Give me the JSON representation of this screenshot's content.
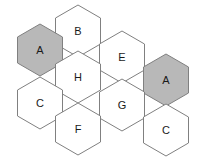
{
  "figure": {
    "name": "hexagon-grid",
    "width": 206,
    "height": 161,
    "background_color": "#ffffff",
    "outline_color": "#808080",
    "outline_width": 1,
    "label_color": "#1a1a1a",
    "fill_white": "#ffffff",
    "fill_shaded": "#b8b8b8",
    "hex_radius": 26,
    "hex_width": 45,
    "hex_height": 52
  },
  "cells": [
    {
      "id": "cell-b",
      "label": "B",
      "cx": 78,
      "cy": 31,
      "shaded": false,
      "fill": "#ffffff"
    },
    {
      "id": "cell-a1",
      "label": "A",
      "cx": 40,
      "cy": 50,
      "shaded": true,
      "fill": "#b8b8b8"
    },
    {
      "id": "cell-e",
      "label": "E",
      "cx": 122,
      "cy": 57,
      "shaded": false,
      "fill": "#ffffff"
    },
    {
      "id": "cell-h",
      "label": "H",
      "cx": 78,
      "cy": 77,
      "shaded": false,
      "fill": "#ffffff"
    },
    {
      "id": "cell-a2",
      "label": "A",
      "cx": 166,
      "cy": 80,
      "shaded": true,
      "fill": "#b8b8b8"
    },
    {
      "id": "cell-c1",
      "label": "C",
      "cx": 40,
      "cy": 103,
      "shaded": false,
      "fill": "#ffffff"
    },
    {
      "id": "cell-g",
      "label": "G",
      "cx": 122,
      "cy": 105,
      "shaded": false,
      "fill": "#ffffff"
    },
    {
      "id": "cell-f",
      "label": "F",
      "cx": 78,
      "cy": 129,
      "shaded": false,
      "fill": "#ffffff"
    },
    {
      "id": "cell-c2",
      "label": "C",
      "cx": 166,
      "cy": 130,
      "shaded": false,
      "fill": "#ffffff"
    }
  ]
}
